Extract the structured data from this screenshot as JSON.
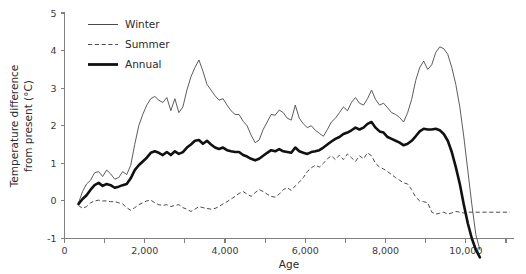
{
  "chart_data": {
    "type": "line",
    "title": "",
    "xlabel": "Age",
    "ylabel": "Temperature difference from present (°C)",
    "ylabel_line1": "Temperature difference",
    "ylabel_line2": "from present (°C)",
    "xlim": [
      0,
      11200
    ],
    "ylim": [
      -1,
      5
    ],
    "xticks": [
      0,
      2000,
      4000,
      6000,
      8000,
      10000
    ],
    "xticklabels": [
      "0",
      "2,000",
      "4,000",
      "6,000",
      "8,000",
      "10,000"
    ],
    "yticks": [
      -1,
      0,
      1,
      2,
      3,
      4,
      5
    ],
    "yticklabels": [
      "-1",
      "0",
      "1",
      "2",
      "3",
      "4",
      "5"
    ],
    "grid": false,
    "legend_position": "top-left",
    "legend": [
      {
        "name": "Winter",
        "style": "thin-solid",
        "color": "#4a4a4a"
      },
      {
        "name": "Summer",
        "style": "dashed",
        "color": "#4a4a4a"
      },
      {
        "name": "Annual",
        "style": "thick-solid",
        "color": "#111111"
      }
    ],
    "series": [
      {
        "name": "Winter",
        "style": "thin-solid",
        "x": [
          350,
          450,
          550,
          650,
          750,
          850,
          950,
          1050,
          1150,
          1250,
          1350,
          1450,
          1550,
          1650,
          1750,
          1850,
          1950,
          2050,
          2150,
          2250,
          2350,
          2450,
          2550,
          2650,
          2750,
          2850,
          2950,
          3050,
          3150,
          3250,
          3350,
          3450,
          3550,
          3650,
          3750,
          3850,
          3950,
          4050,
          4150,
          4250,
          4350,
          4450,
          4550,
          4650,
          4750,
          4850,
          4950,
          5050,
          5150,
          5250,
          5350,
          5450,
          5550,
          5650,
          5750,
          5850,
          5950,
          6050,
          6150,
          6250,
          6350,
          6450,
          6550,
          6650,
          6750,
          6850,
          6950,
          7050,
          7150,
          7250,
          7350,
          7450,
          7550,
          7650,
          7750,
          7850,
          7950,
          8050,
          8150,
          8250,
          8350,
          8450,
          8550,
          8650,
          8750,
          8850,
          8950,
          9050,
          9150,
          9250,
          9350,
          9450,
          9550,
          9650,
          9750,
          9850,
          9950,
          10050,
          10150,
          10250,
          10350
        ],
        "y": [
          -0.05,
          0.25,
          0.45,
          0.55,
          0.75,
          0.78,
          0.65,
          0.82,
          0.72,
          0.58,
          0.62,
          0.78,
          0.7,
          0.95,
          1.5,
          2.0,
          2.3,
          2.55,
          2.72,
          2.78,
          2.68,
          2.62,
          2.75,
          2.4,
          2.72,
          2.35,
          2.5,
          2.95,
          3.3,
          3.55,
          3.75,
          3.45,
          3.1,
          2.95,
          2.8,
          2.68,
          2.72,
          2.55,
          2.4,
          2.3,
          2.3,
          2.12,
          2.0,
          1.75,
          1.55,
          1.62,
          1.9,
          2.1,
          2.3,
          2.28,
          2.42,
          2.35,
          2.2,
          2.15,
          2.55,
          2.2,
          2.05,
          1.95,
          2.0,
          1.88,
          1.8,
          1.72,
          1.9,
          2.1,
          2.2,
          2.35,
          2.5,
          2.4,
          2.62,
          2.75,
          2.6,
          2.55,
          2.72,
          2.95,
          2.7,
          2.55,
          2.6,
          2.48,
          2.35,
          2.3,
          2.22,
          2.1,
          2.35,
          2.7,
          3.2,
          3.55,
          3.72,
          3.5,
          3.62,
          3.95,
          4.1,
          4.05,
          3.9,
          3.55,
          3.1,
          2.5,
          1.7,
          0.8,
          -0.1,
          -0.9,
          -1.3
        ]
      },
      {
        "name": "Summer",
        "style": "dashed",
        "x": [
          350,
          450,
          550,
          650,
          750,
          850,
          950,
          1050,
          1150,
          1250,
          1350,
          1450,
          1550,
          1650,
          1750,
          1850,
          1950,
          2050,
          2150,
          2250,
          2350,
          2450,
          2550,
          2650,
          2750,
          2850,
          2950,
          3050,
          3150,
          3250,
          3350,
          3450,
          3550,
          3650,
          3750,
          3850,
          3950,
          4050,
          4150,
          4250,
          4350,
          4450,
          4550,
          4650,
          4750,
          4850,
          4950,
          5050,
          5150,
          5250,
          5350,
          5450,
          5550,
          5650,
          5750,
          5850,
          5950,
          6050,
          6150,
          6250,
          6350,
          6450,
          6550,
          6650,
          6750,
          6850,
          6950,
          7050,
          7150,
          7250,
          7350,
          7450,
          7550,
          7650,
          7750,
          7850,
          7950,
          8050,
          8150,
          8250,
          8350,
          8450,
          8550,
          8650,
          8750,
          8850,
          8950,
          9050,
          9150,
          9250,
          9350,
          9450,
          9550,
          9650,
          9750,
          9850,
          9950,
          10050,
          10150,
          10250,
          10350,
          10500,
          10700,
          10900,
          11100
        ],
        "y": [
          -0.12,
          -0.2,
          -0.15,
          -0.05,
          0.0,
          0.02,
          0.0,
          0.0,
          -0.02,
          -0.02,
          -0.05,
          -0.08,
          -0.18,
          -0.25,
          -0.18,
          -0.1,
          -0.05,
          0.0,
          0.02,
          -0.05,
          -0.1,
          -0.12,
          -0.1,
          -0.15,
          -0.12,
          -0.1,
          -0.18,
          -0.22,
          -0.28,
          -0.22,
          -0.15,
          -0.18,
          -0.2,
          -0.22,
          -0.2,
          -0.15,
          -0.08,
          -0.02,
          0.05,
          0.12,
          0.2,
          0.25,
          0.18,
          0.12,
          0.22,
          0.3,
          0.25,
          0.18,
          0.12,
          0.1,
          0.18,
          0.3,
          0.35,
          0.28,
          0.4,
          0.5,
          0.62,
          0.78,
          0.88,
          0.95,
          0.9,
          1.0,
          1.12,
          1.2,
          1.1,
          1.22,
          1.1,
          1.25,
          1.15,
          1.05,
          1.2,
          1.12,
          1.28,
          1.2,
          1.0,
          0.9,
          0.85,
          0.78,
          0.7,
          0.62,
          0.55,
          0.48,
          0.45,
          0.3,
          0.1,
          0.0,
          -0.02,
          -0.05,
          -0.3,
          -0.35,
          -0.33,
          -0.3,
          -0.35,
          -0.32,
          -0.28,
          -0.3,
          -0.32,
          -0.3,
          -0.3,
          -0.3,
          -0.3,
          -0.3,
          -0.3,
          -0.3,
          -0.3
        ]
      },
      {
        "name": "Annual",
        "style": "thick-solid",
        "x": [
          350,
          450,
          550,
          650,
          750,
          850,
          950,
          1050,
          1150,
          1250,
          1350,
          1450,
          1550,
          1650,
          1750,
          1850,
          1950,
          2050,
          2150,
          2250,
          2350,
          2450,
          2550,
          2650,
          2750,
          2850,
          2950,
          3050,
          3150,
          3250,
          3350,
          3450,
          3550,
          3650,
          3750,
          3850,
          3950,
          4050,
          4150,
          4250,
          4350,
          4450,
          4550,
          4650,
          4750,
          4850,
          4950,
          5050,
          5150,
          5250,
          5350,
          5450,
          5550,
          5650,
          5750,
          5850,
          5950,
          6050,
          6150,
          6250,
          6350,
          6450,
          6550,
          6650,
          6750,
          6850,
          6950,
          7050,
          7150,
          7250,
          7350,
          7450,
          7550,
          7650,
          7750,
          7850,
          7950,
          8050,
          8150,
          8250,
          8350,
          8450,
          8550,
          8650,
          8750,
          8850,
          8950,
          9050,
          9150,
          9250,
          9350,
          9450,
          9550,
          9650,
          9750,
          9850,
          9950,
          10050,
          10150,
          10250,
          10350
        ],
        "y": [
          -0.08,
          0.05,
          0.15,
          0.3,
          0.42,
          0.48,
          0.4,
          0.45,
          0.42,
          0.35,
          0.38,
          0.42,
          0.45,
          0.6,
          0.82,
          0.95,
          1.05,
          1.15,
          1.28,
          1.32,
          1.28,
          1.22,
          1.3,
          1.22,
          1.32,
          1.25,
          1.3,
          1.42,
          1.5,
          1.6,
          1.62,
          1.52,
          1.6,
          1.5,
          1.42,
          1.38,
          1.42,
          1.35,
          1.32,
          1.3,
          1.3,
          1.22,
          1.18,
          1.12,
          1.08,
          1.12,
          1.2,
          1.28,
          1.35,
          1.32,
          1.38,
          1.32,
          1.3,
          1.28,
          1.42,
          1.32,
          1.28,
          1.25,
          1.3,
          1.32,
          1.35,
          1.42,
          1.5,
          1.58,
          1.65,
          1.7,
          1.78,
          1.82,
          1.88,
          1.95,
          1.9,
          1.95,
          2.05,
          2.1,
          1.95,
          1.85,
          1.82,
          1.7,
          1.65,
          1.6,
          1.55,
          1.48,
          1.52,
          1.6,
          1.72,
          1.85,
          1.92,
          1.9,
          1.9,
          1.92,
          1.88,
          1.78,
          1.6,
          1.3,
          0.9,
          0.45,
          -0.1,
          -0.6,
          -1.0,
          -1.3,
          -1.5
        ]
      }
    ]
  },
  "axes": {
    "x_title": "Age",
    "y_title_line1": "Temperature difference",
    "y_title_line2": "from present (°C)"
  }
}
